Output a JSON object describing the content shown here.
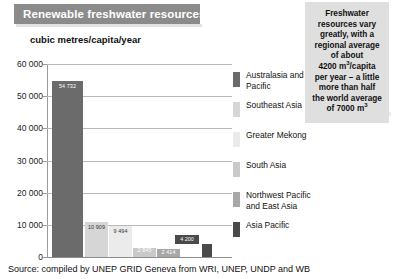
{
  "header": {
    "title": "Renewable freshwater resources"
  },
  "callout": {
    "line1": "Freshwater",
    "line2": "resources vary",
    "line3": "greatly, with a",
    "line4": "regional average",
    "line5": "of about",
    "line6_pre": "4200 m",
    "line6_sup": "3",
    "line6_post": "/capita",
    "line7": "per year – a little",
    "line8": "more than half",
    "line9": "the world average",
    "line10_pre": "of 7000 m",
    "line10_sup": "3"
  },
  "source": {
    "text": "Source: compiled by UNEP GRID Geneva from WRI, UNEP, UNDP and WB"
  },
  "colors": {
    "title_bar": "#8b8b8b",
    "callout_bg": "#dfdfdf",
    "axis": "#9a9a9a",
    "grid": "#b9b9b9"
  },
  "chart_data": {
    "type": "bar",
    "title": "Renewable freshwater resources",
    "xlabel": "",
    "ylabel": "cubic metres/capita/year",
    "ylim": [
      0,
      60000
    ],
    "ytick_labels": [
      "60 000",
      "50 000",
      "40 000",
      "30 000",
      "20 000",
      "10 000",
      "0"
    ],
    "ytick_values": [
      60000,
      50000,
      40000,
      30000,
      20000,
      10000,
      0
    ],
    "grid": true,
    "legend_position": "right",
    "categories": [
      "Australasia and the Pacific",
      "Southeast Asia",
      "Greater Mekong",
      "South Asia",
      "Northwest Pacific and East Asia",
      "Asia Pacific"
    ],
    "values": [
      54732,
      10909,
      9494,
      2845,
      2414,
      4200
    ],
    "value_labels": [
      "54 732",
      "10 909",
      "9 494",
      "2 845",
      "2 414",
      "4 200"
    ],
    "bar_colors": [
      "#6b6b6b",
      "#d6d6d6",
      "#ebebeb",
      "#c9c9c9",
      "#a8a8a8",
      "#4a4a4a"
    ]
  }
}
